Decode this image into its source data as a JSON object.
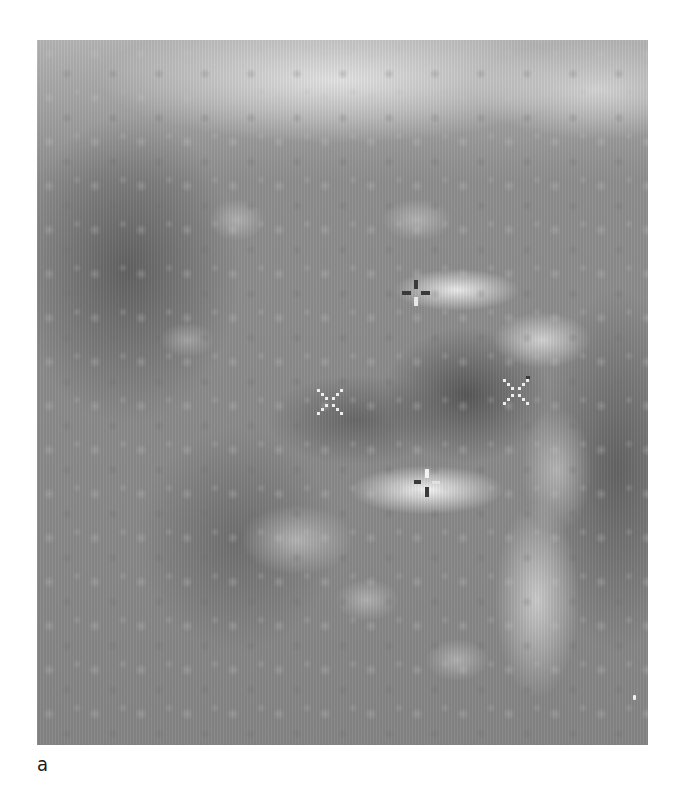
{
  "figure": {
    "label": "a",
    "type": "grayscale ultrasound image",
    "bounds": {
      "x": 37,
      "y": 40,
      "width": 611,
      "height": 705
    },
    "colors": {
      "background": "#ffffff",
      "tissue_mid": "#8a8a8a",
      "echogenic": "#f0f0f0",
      "hypoechoic": "#555555"
    }
  },
  "calipers": [
    {
      "id": "top",
      "shape": "plus",
      "style": "dark",
      "x": 416,
      "y": 293
    },
    {
      "id": "left",
      "shape": "x",
      "style": "light-dotted",
      "x": 330,
      "y": 402
    },
    {
      "id": "right",
      "shape": "x",
      "style": "light-dotted",
      "x": 516,
      "y": 392
    },
    {
      "id": "bottom",
      "shape": "plus",
      "style": "mixed",
      "x": 427,
      "y": 483
    }
  ]
}
